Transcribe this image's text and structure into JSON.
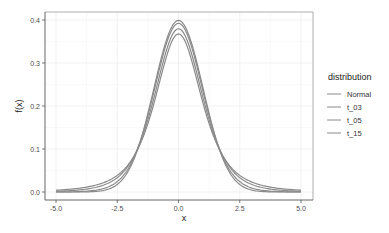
{
  "chart_data": {
    "type": "line",
    "title": "",
    "xlabel": "x",
    "ylabel": "f(x)",
    "xlim": [
      -5.0,
      5.0
    ],
    "ylim": [
      0.0,
      0.4
    ],
    "x_ticks": [
      -5.0,
      -2.5,
      0.0,
      2.5,
      5.0
    ],
    "x_tick_labels": [
      "-5.0",
      "-2.5",
      "0.0",
      "2.5",
      "5.0"
    ],
    "y_ticks": [
      0.0,
      0.1,
      0.2,
      0.3,
      0.4
    ],
    "y_tick_labels": [
      "0.0",
      "0.1",
      "0.2",
      "0.3",
      "0.4"
    ],
    "grid": true,
    "legend": {
      "title": "distribution",
      "placement": "right",
      "entries": [
        "Normal",
        "t_03",
        "t_05",
        "t_15"
      ]
    },
    "series": [
      {
        "name": "Normal",
        "distribution": "normal",
        "peak": 0.399
      },
      {
        "name": "t_03",
        "distribution": "student-t",
        "df": 3,
        "peak": 0.368
      },
      {
        "name": "t_05",
        "distribution": "student-t",
        "df": 5,
        "peak": 0.38
      },
      {
        "name": "t_15",
        "distribution": "student-t",
        "df": 15,
        "peak": 0.393
      }
    ],
    "series_color": "#8a8a8a"
  }
}
